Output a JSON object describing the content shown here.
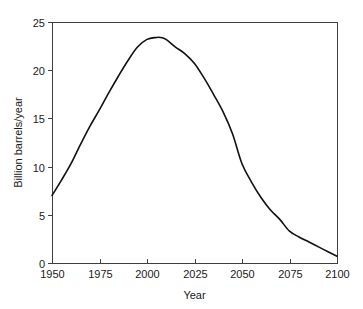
{
  "chart_data": {
    "type": "line",
    "title": "",
    "subtitle": "",
    "xlabel": "Year",
    "ylabel": "Billion barrels/year",
    "xlim": [
      1950,
      2100
    ],
    "ylim": [
      0,
      25
    ],
    "grid": false,
    "legend": null,
    "legend_position": "none",
    "x_ticks": [
      1950,
      1975,
      2000,
      2025,
      2050,
      2075,
      2100
    ],
    "x_tick_labels": [
      "1950",
      "1975",
      "2000",
      "2025",
      "2050",
      "2075",
      "2100"
    ],
    "y_ticks": [
      0,
      5,
      10,
      15,
      20,
      25
    ],
    "y_tick_labels": [
      "0",
      "5",
      "10",
      "15",
      "20",
      "25"
    ],
    "series": [
      {
        "name": "World oil production",
        "color": "#111111",
        "x": [
          1950,
          1955,
          1960,
          1965,
          1970,
          1975,
          1980,
          1985,
          1990,
          1995,
          2000,
          2005,
          2007,
          2010,
          2015,
          2020,
          2025,
          2030,
          2035,
          2040,
          2045,
          2050,
          2055,
          2060,
          2065,
          2070,
          2075,
          2080,
          2085,
          2090,
          2095,
          2100
        ],
        "y": [
          7.0,
          8.6,
          10.3,
          12.3,
          14.2,
          15.9,
          17.7,
          19.4,
          21.0,
          22.4,
          23.2,
          23.4,
          23.4,
          23.2,
          22.4,
          21.7,
          20.7,
          19.2,
          17.5,
          15.7,
          13.4,
          10.3,
          8.4,
          6.8,
          5.5,
          4.5,
          3.3,
          2.7,
          2.2,
          1.7,
          1.2,
          0.7
        ]
      }
    ],
    "annotations": []
  },
  "axes": {
    "x_axis_label": "Year",
    "y_axis_label": "Billion barrels/year"
  },
  "colors": {
    "curve": "#111111",
    "frame": "#3f3f3f",
    "text": "#1a1a1a",
    "background": "#ffffff"
  }
}
